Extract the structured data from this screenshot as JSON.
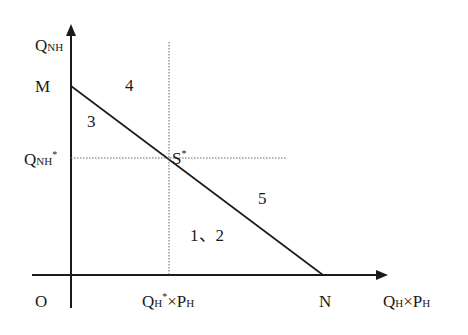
{
  "diagram": {
    "type": "economics-budget-line",
    "axes": {
      "y_label": {
        "main": "Q",
        "sub": "NH"
      },
      "x_label": {
        "q": "Q",
        "q_sub": "H",
        "times": "×",
        "p": "P",
        "p_sub": "H"
      },
      "origin": "O"
    },
    "points": {
      "y_intercept": "M",
      "x_intercept": "N",
      "equilibrium": {
        "main": "S",
        "sup": "*"
      }
    },
    "equilibrium_ticks": {
      "y_tick": {
        "main": "Q",
        "sub": "NH",
        "sup": "*"
      },
      "x_tick": {
        "q": "Q",
        "q_sub": "H",
        "q_sup": "*",
        "times": "×",
        "p": "P",
        "p_sub": "H"
      }
    },
    "regions": {
      "r12": "1、2",
      "r3": "3",
      "r4": "4",
      "r5": "5"
    },
    "colors": {
      "line": "#1a1a1a",
      "dotted": "#555555",
      "background": "#ffffff"
    }
  }
}
